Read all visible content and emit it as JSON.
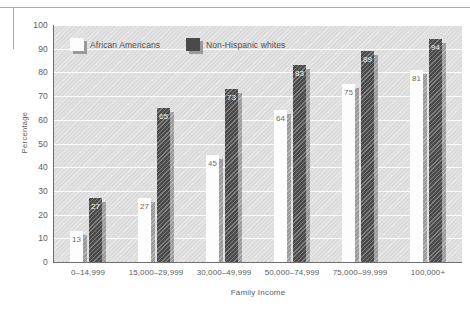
{
  "chart_data": {
    "type": "bar",
    "title": "",
    "subtitle": "",
    "xlabel": "Family Income",
    "ylabel": "Percentage",
    "ylim": [
      0,
      100
    ],
    "ytick_step": 10,
    "yticks": [
      "100",
      "90",
      "80",
      "70",
      "60",
      "50",
      "40",
      "30",
      "20",
      "10",
      "0"
    ],
    "grid": true,
    "grid_axis": "y",
    "legend_position": "top-left-inside",
    "categories": [
      "0–14,999",
      "15,000–29,999",
      "30,000–49,999",
      "50,000–74,999",
      "75,000–99,999",
      "100,000+"
    ],
    "series": [
      {
        "name": "African Americans",
        "color": "#fdfdfd",
        "values": [
          13,
          27,
          45,
          64,
          75,
          81
        ]
      },
      {
        "name": "Non-Hispanic whites",
        "color": "#4a4a4a",
        "values": [
          27,
          65,
          73,
          83,
          89,
          94
        ]
      }
    ],
    "data_labels": [
      [
        "13",
        "27"
      ],
      [
        "27",
        "65"
      ],
      [
        "45",
        "73"
      ],
      [
        "64",
        "83"
      ],
      [
        "75",
        "89"
      ],
      [
        "81",
        "94"
      ]
    ],
    "colors": {
      "plot_background": "#dcdcdc",
      "gridline": "#ffffff",
      "axis": "#6e6e6e",
      "bar_shadow": "#9a9a9a",
      "text": "#5c5c5c",
      "rule": "#a9a9a9"
    }
  },
  "legend": {
    "items": [
      {
        "label": "African Americans",
        "key": "aa"
      },
      {
        "label": "Non-Hispanic whites",
        "key": "nhw"
      }
    ]
  }
}
